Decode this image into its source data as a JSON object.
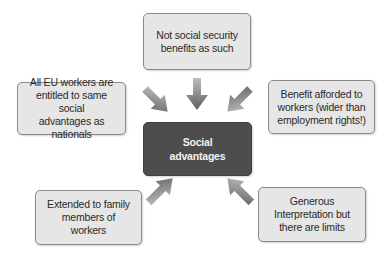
{
  "diagram": {
    "type": "hub-and-spoke",
    "center": {
      "label": "Social\nadvantages",
      "fill": "#4d4d4d",
      "text_color": "#f2f2f2"
    },
    "nodes": [
      {
        "id": "top",
        "label": "Not social security\nbenefits as such"
      },
      {
        "id": "left",
        "label": "All EU workers are\nentitled to same social\nadvantages as nationals"
      },
      {
        "id": "right",
        "label": "Benefit afforded to\nworkers (wider than\nemployment rights!)"
      },
      {
        "id": "bottom_left",
        "label": "Extended to family\nmembers of\nworkers"
      },
      {
        "id": "bottom_right",
        "label": "Generous\nInterpretation but\nthere are limits"
      }
    ],
    "edges": [
      {
        "from": "top",
        "to": "center"
      },
      {
        "from": "left",
        "to": "center"
      },
      {
        "from": "right",
        "to": "center"
      },
      {
        "from": "bottom_left",
        "to": "center"
      },
      {
        "from": "bottom_right",
        "to": "center"
      }
    ],
    "colors": {
      "node_fill": "#e6e6e6",
      "node_border": "#8a8a8a",
      "arrow": "#6e6e6e"
    }
  }
}
